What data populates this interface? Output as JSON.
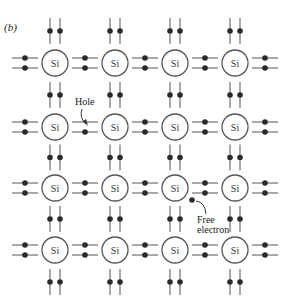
{
  "figure": {
    "label": "(b)",
    "atom_symbol": "Si",
    "grid": {
      "columns": [
        55,
        115,
        175,
        235
      ],
      "rows": [
        63,
        127,
        188,
        250
      ],
      "atom_radius": 13
    },
    "colors": {
      "line": "#555555",
      "electron": "#2a2a2a",
      "background": "#ffffff"
    },
    "annotations": {
      "hole": {
        "text": "Hole",
        "target": [
          87,
          132
        ]
      },
      "free_electron": {
        "line1": "Free",
        "line2": "electron",
        "position": [
          192,
          200
        ]
      }
    }
  }
}
